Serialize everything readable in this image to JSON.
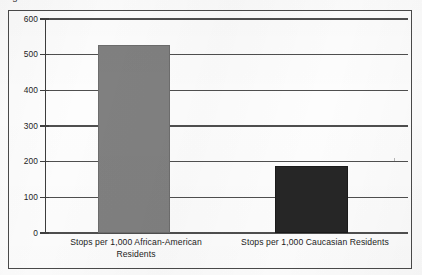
{
  "document": {
    "cut_off_caption": "Figure 1",
    "frame_border_color": "#4a4a4a",
    "background_color": "#fdfdfd"
  },
  "chart_data": {
    "type": "bar",
    "title": "",
    "subtitle": "",
    "xlabel": "",
    "ylabel": "",
    "categories": [
      "Stops per 1,000 African-American Residents",
      "Stops per 1,000 Caucasian Residents"
    ],
    "category_lines": [
      [
        "Stops per 1,000 African-American",
        "Residents"
      ],
      [
        "Stops per 1,000 Caucasian Residents"
      ]
    ],
    "values": [
      528,
      188
    ],
    "value_labels": [
      "528",
      "188"
    ],
    "bar_colors": [
      "#808080",
      "#262626"
    ],
    "ylim": [
      0,
      600
    ],
    "ytick_step": 100,
    "ytick_labels": [
      "600",
      "500",
      "400",
      "300",
      "200",
      "100",
      "0"
    ],
    "ytick_values": [
      600,
      500,
      400,
      300,
      200,
      100,
      0
    ],
    "grid": true,
    "grid_orientation": "horizontal",
    "grid_color": "#4f4f4f",
    "legend": false,
    "legend_position": "none",
    "annotations": []
  }
}
